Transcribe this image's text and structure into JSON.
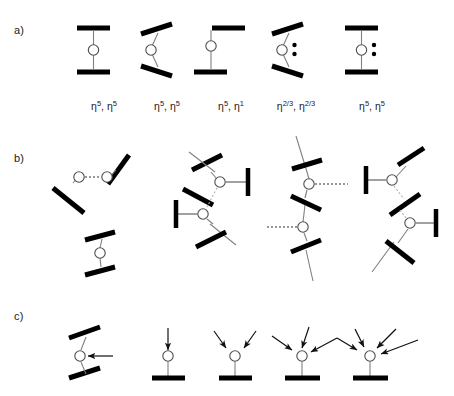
{
  "figure": {
    "background": "#ffffff",
    "ink_color": "#000000",
    "thin_line_color": "#8c8c8c",
    "width": 454,
    "height": 396
  },
  "rows": [
    {
      "id": "row-a",
      "label": "a)",
      "label_x": 14,
      "label_y": 32,
      "description": "Sandwich and half-sandwich metallocene coordination modes",
      "structures": [
        {
          "name": "parallel-sandwich",
          "eta_label": "η5, η5",
          "eta_parts": [
            {
              "base": "η",
              "sup": "5"
            },
            {
              "base": "η",
              "sup": "5"
            }
          ],
          "label_x": 104,
          "label_y": 108,
          "lone_pair": false
        },
        {
          "name": "bent-sandwich",
          "eta_label": "η5, η5",
          "eta_parts": [
            {
              "base": "η",
              "sup": "5"
            },
            {
              "base": "η",
              "sup": "5"
            }
          ],
          "label_x": 167,
          "label_y": 108,
          "lone_pair": false
        },
        {
          "name": "slipped-sandwich-eta5-eta1",
          "eta_label": "η5, η1",
          "eta_parts": [
            {
              "base": "η",
              "sup": "5"
            },
            {
              "base": "η",
              "sup": "1"
            }
          ],
          "label_x": 231,
          "label_y": 108,
          "lone_pair": false
        },
        {
          "name": "bent-sandwich-lone-pair-eta23",
          "eta_label": "η2/3, η2/3",
          "eta_parts": [
            {
              "base": "η",
              "sup": "2/3"
            },
            {
              "base": "η",
              "sup": "2/3"
            }
          ],
          "label_x": 296,
          "label_y": 108,
          "lone_pair": true
        },
        {
          "name": "parallel-sandwich-lone-pair",
          "eta_label": "η5, η5",
          "eta_parts": [
            {
              "base": "η",
              "sup": "5"
            },
            {
              "base": "η",
              "sup": "5"
            }
          ],
          "label_x": 372,
          "label_y": 108,
          "lone_pair": true
        }
      ]
    },
    {
      "id": "row-b",
      "label": "b)",
      "label_x": 14,
      "label_y": 160,
      "description": "Oligomeric and polymeric bridged chain motifs with dashed intermolecular contacts",
      "structures": [
        {
          "name": "dimer-with-separate-sandwich",
          "dashed_contacts": 1
        },
        {
          "name": "zigzag-chain-terminal-bars",
          "dashed_contacts": 2
        },
        {
          "name": "vertical-polymer-chain",
          "dashed_contacts": 2
        },
        {
          "name": "zigzag-chain-right-terminal-bars",
          "dashed_contacts": 2
        }
      ]
    },
    {
      "id": "row-c",
      "label": "c)",
      "label_x": 14,
      "label_y": 318,
      "description": "Half-sandwich complexes with increasing numbers of donor-arrow ligands",
      "structures": [
        {
          "name": "bent-sandwich-one-donor",
          "donor_arrows": 1,
          "orientation": "side"
        },
        {
          "name": "half-sandwich-one-donor",
          "donor_arrows": 1,
          "orientation": "top"
        },
        {
          "name": "half-sandwich-two-donors",
          "donor_arrows": 2,
          "orientation": "top"
        },
        {
          "name": "half-sandwich-three-donors",
          "donor_arrows": 3,
          "orientation": "top"
        },
        {
          "name": "half-sandwich-four-donors",
          "donor_arrows": 4,
          "orientation": "top"
        }
      ]
    }
  ]
}
